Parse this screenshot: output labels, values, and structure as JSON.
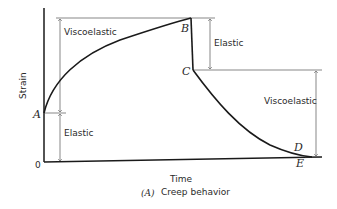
{
  "diagram": {
    "caption_prefix": "(A)",
    "caption": "Creep behavior",
    "xlabel": "Time",
    "ylabel": "Strain",
    "origin_label": "0",
    "points": {
      "A": "A",
      "B": "B",
      "C": "C",
      "D": "D",
      "E": "E"
    },
    "annotations": {
      "left_viscoelastic": "Viscoelastic",
      "left_elastic": "Elastic",
      "right_elastic": "Elastic",
      "right_viscoelastic": "Viscoelastic"
    },
    "colors": {
      "curve": "#1a1a1a",
      "axis": "#1a1a1a",
      "guide": "#555555"
    }
  }
}
